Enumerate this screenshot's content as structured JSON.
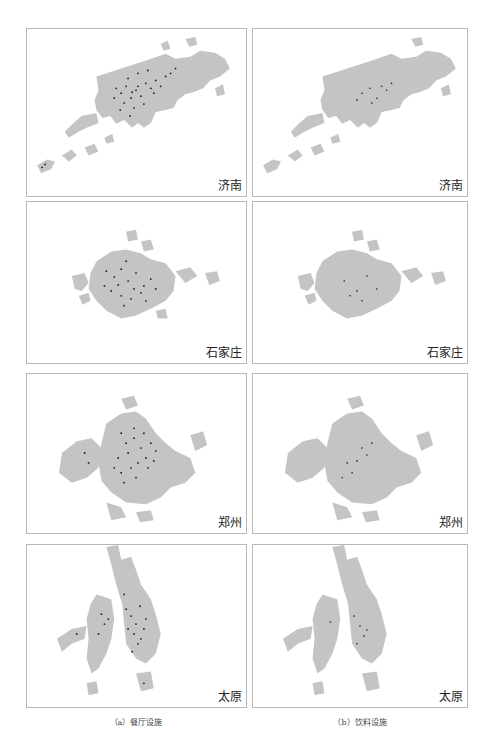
{
  "figure": {
    "columns": [
      {
        "caption": "（a）餐厅设施"
      },
      {
        "caption": "（b）饮料设施"
      }
    ],
    "rows": [
      {
        "city": "济南"
      },
      {
        "city": "石家庄"
      },
      {
        "city": "郑州"
      },
      {
        "city": "太原"
      }
    ],
    "colors": {
      "urban_area": "#c4c4c4",
      "facility_points": "#1a1a1a",
      "frame": "#b8b8b8"
    },
    "panels": [
      {
        "row": 0,
        "col": 0,
        "city": "济南",
        "category": "餐厅设施"
      },
      {
        "row": 0,
        "col": 1,
        "city": "济南",
        "category": "饮料设施"
      },
      {
        "row": 1,
        "col": 0,
        "city": "石家庄",
        "category": "餐厅设施"
      },
      {
        "row": 1,
        "col": 1,
        "city": "石家庄",
        "category": "饮料设施"
      },
      {
        "row": 2,
        "col": 0,
        "city": "郑州",
        "category": "餐厅设施"
      },
      {
        "row": 2,
        "col": 1,
        "city": "郑州",
        "category": "饮料设施"
      },
      {
        "row": 3,
        "col": 0,
        "city": "太原",
        "category": "餐厅设施"
      },
      {
        "row": 3,
        "col": 1,
        "city": "太原",
        "category": "饮料设施"
      }
    ]
  }
}
